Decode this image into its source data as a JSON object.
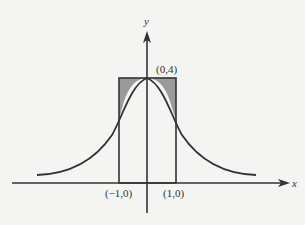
{
  "diagram": {
    "axes": {
      "x_label": "x",
      "y_label": "y"
    },
    "points": {
      "peak": "(0,4)",
      "left_base": "(−1,0)",
      "right_base": "(1,0)"
    },
    "colors": {
      "curve": "#333333",
      "shade": "#9a9a9a",
      "background": "#f4f4f2"
    }
  }
}
